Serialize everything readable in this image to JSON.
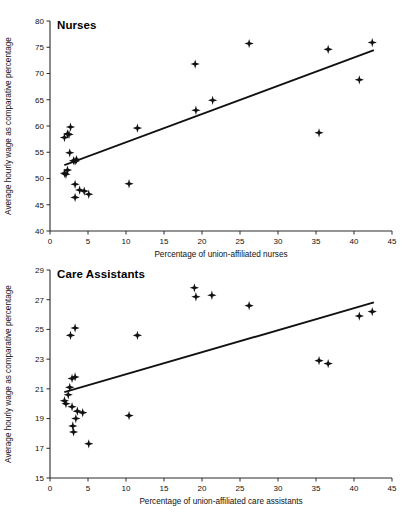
{
  "figure": {
    "background": "#ffffff",
    "ink_color": "#111111",
    "marker_color": "#111111",
    "marker_shape": "diamond-plus"
  },
  "chart_data": [
    {
      "type": "scatter",
      "id": "nurses",
      "title": "Nurses",
      "xlabel": "Percentage of union-affiliated nurses",
      "ylabel": "Average hourly wage as comparative percentage",
      "xlim": [
        0,
        45
      ],
      "ylim": [
        40,
        80
      ],
      "xticks": [
        0,
        5,
        10,
        15,
        20,
        25,
        30,
        35,
        40,
        45
      ],
      "yticks": [
        40,
        45,
        50,
        55,
        60,
        65,
        70,
        75,
        80
      ],
      "grid": false,
      "legend": "none",
      "points": [
        {
          "x": 1.9,
          "y": 57.8
        },
        {
          "x": 2.3,
          "y": 58.5
        },
        {
          "x": 2.5,
          "y": 58.4
        },
        {
          "x": 2.7,
          "y": 59.8
        },
        {
          "x": 2.6,
          "y": 54.9
        },
        {
          "x": 1.9,
          "y": 51.0
        },
        {
          "x": 2.1,
          "y": 50.8
        },
        {
          "x": 2.3,
          "y": 51.6
        },
        {
          "x": 3.1,
          "y": 53.4
        },
        {
          "x": 3.3,
          "y": 53.3
        },
        {
          "x": 3.5,
          "y": 53.6
        },
        {
          "x": 3.3,
          "y": 48.9
        },
        {
          "x": 3.3,
          "y": 46.4
        },
        {
          "x": 3.9,
          "y": 47.8
        },
        {
          "x": 4.5,
          "y": 47.6
        },
        {
          "x": 5.1,
          "y": 47.0
        },
        {
          "x": 10.4,
          "y": 49.0
        },
        {
          "x": 11.5,
          "y": 59.6
        },
        {
          "x": 19.1,
          "y": 71.8
        },
        {
          "x": 19.2,
          "y": 63.0
        },
        {
          "x": 21.4,
          "y": 64.9
        },
        {
          "x": 26.2,
          "y": 75.7
        },
        {
          "x": 35.4,
          "y": 58.7
        },
        {
          "x": 36.6,
          "y": 74.6
        },
        {
          "x": 40.7,
          "y": 68.8
        },
        {
          "x": 42.4,
          "y": 75.9
        }
      ],
      "trend": {
        "x1": 2.0,
        "y1": 52.6,
        "x2": 42.5,
        "y2": 74.4
      }
    },
    {
      "type": "scatter",
      "id": "care-assistants",
      "title": "Care Assistants",
      "xlabel": "Percentage of union-affiliated care assistants",
      "ylabel": "Average hourly wage as comparative percentage",
      "xlim": [
        0,
        45
      ],
      "ylim": [
        15,
        29
      ],
      "xticks": [
        0,
        5,
        10,
        15,
        20,
        25,
        30,
        35,
        40,
        45
      ],
      "yticks": [
        15,
        17,
        19,
        21,
        23,
        25,
        27,
        29
      ],
      "grid": false,
      "legend": "none",
      "points": [
        {
          "x": 2.7,
          "y": 24.6
        },
        {
          "x": 3.3,
          "y": 25.1
        },
        {
          "x": 2.9,
          "y": 21.7
        },
        {
          "x": 3.3,
          "y": 21.8
        },
        {
          "x": 2.6,
          "y": 21.1
        },
        {
          "x": 2.4,
          "y": 20.6
        },
        {
          "x": 1.9,
          "y": 20.2
        },
        {
          "x": 2.1,
          "y": 20.0
        },
        {
          "x": 2.9,
          "y": 19.8
        },
        {
          "x": 3.6,
          "y": 19.5
        },
        {
          "x": 4.3,
          "y": 19.4
        },
        {
          "x": 3.4,
          "y": 19.0
        },
        {
          "x": 3.0,
          "y": 18.5
        },
        {
          "x": 3.1,
          "y": 18.1
        },
        {
          "x": 5.1,
          "y": 17.3
        },
        {
          "x": 10.4,
          "y": 19.2
        },
        {
          "x": 11.5,
          "y": 24.6
        },
        {
          "x": 19.0,
          "y": 27.8
        },
        {
          "x": 19.2,
          "y": 27.2
        },
        {
          "x": 21.3,
          "y": 27.3
        },
        {
          "x": 26.2,
          "y": 26.6
        },
        {
          "x": 35.4,
          "y": 22.9
        },
        {
          "x": 36.6,
          "y": 22.7
        },
        {
          "x": 40.7,
          "y": 25.9
        },
        {
          "x": 42.4,
          "y": 26.2
        }
      ],
      "trend": {
        "x1": 2.0,
        "y1": 20.8,
        "x2": 42.5,
        "y2": 26.8
      }
    }
  ]
}
